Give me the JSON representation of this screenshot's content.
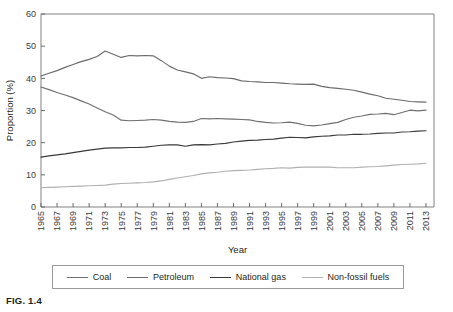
{
  "figure": {
    "caption": "FIG. 1.4"
  },
  "chart_data": {
    "type": "line",
    "title": "",
    "xlabel": "Year",
    "ylabel": "Proportion (%)",
    "xlim": [
      1965,
      2014
    ],
    "ylim": [
      0,
      60
    ],
    "grid": false,
    "legend_position": "bottom",
    "yticks": [
      0,
      10,
      20,
      30,
      40,
      50,
      60
    ],
    "ytick_labels": [
      "0",
      "10",
      "20",
      "30",
      "40",
      "50",
      "60"
    ],
    "xticks": [
      1965,
      1967,
      1969,
      1971,
      1973,
      1975,
      1977,
      1979,
      1981,
      1983,
      1985,
      1987,
      1989,
      1991,
      1993,
      1995,
      1997,
      1999,
      2001,
      2003,
      2005,
      2007,
      2009,
      2011,
      2013
    ],
    "xtick_labels": [
      "1965",
      "1967",
      "1969",
      "1971",
      "1973",
      "1975",
      "1977",
      "1979",
      "1981",
      "1983",
      "1985",
      "1987",
      "1989",
      "1991",
      "1993",
      "1995",
      "1997",
      "1999",
      "2001",
      "2003",
      "2005",
      "2007",
      "2009",
      "2011",
      "2013"
    ],
    "x": [
      1965,
      1966,
      1967,
      1968,
      1969,
      1970,
      1971,
      1972,
      1973,
      1974,
      1975,
      1976,
      1977,
      1978,
      1979,
      1980,
      1981,
      1982,
      1983,
      1984,
      1985,
      1986,
      1987,
      1988,
      1989,
      1990,
      1991,
      1992,
      1993,
      1994,
      1995,
      1996,
      1997,
      1998,
      1999,
      2000,
      2001,
      2002,
      2003,
      2004,
      2005,
      2006,
      2007,
      2008,
      2009,
      2010,
      2011,
      2012,
      2013
    ],
    "series": [
      {
        "name": "Coal",
        "color": "#6f6f6f",
        "values": [
          37.3,
          36.5,
          35.6,
          34.8,
          34.0,
          33.0,
          32.0,
          30.8,
          29.6,
          28.6,
          27.0,
          26.8,
          26.9,
          27.0,
          27.2,
          27.0,
          26.6,
          26.4,
          26.3,
          26.6,
          27.5,
          27.4,
          27.5,
          27.4,
          27.3,
          27.2,
          27.1,
          26.6,
          26.3,
          26.1,
          26.2,
          26.4,
          26.0,
          25.4,
          25.2,
          25.5,
          25.9,
          26.3,
          27.2,
          27.9,
          28.3,
          28.8,
          28.9,
          29.1,
          28.7,
          29.4,
          30.1,
          29.9,
          30.1
        ]
      },
      {
        "name": "Petroleum",
        "color": "#6b6b6b",
        "values": [
          40.7,
          41.6,
          42.4,
          43.4,
          44.3,
          45.2,
          45.9,
          46.8,
          48.5,
          47.5,
          46.5,
          47.1,
          47.0,
          47.1,
          47.0,
          45.5,
          43.8,
          42.6,
          42.0,
          41.4,
          40.0,
          40.5,
          40.2,
          40.1,
          39.9,
          39.2,
          39.0,
          38.9,
          38.7,
          38.7,
          38.5,
          38.3,
          38.2,
          38.1,
          38.2,
          37.5,
          37.1,
          36.9,
          36.6,
          36.3,
          35.7,
          35.1,
          34.6,
          33.8,
          33.5,
          33.2,
          32.8,
          32.7,
          32.6
        ]
      },
      {
        "name": "National gas",
        "color": "#3a3a3a",
        "values": [
          15.5,
          15.9,
          16.2,
          16.5,
          16.9,
          17.3,
          17.7,
          18.0,
          18.3,
          18.4,
          18.4,
          18.5,
          18.5,
          18.6,
          18.9,
          19.2,
          19.3,
          19.3,
          18.9,
          19.3,
          19.4,
          19.3,
          19.6,
          19.8,
          20.2,
          20.5,
          20.7,
          20.8,
          21.0,
          21.1,
          21.4,
          21.7,
          21.6,
          21.5,
          21.8,
          22.0,
          22.1,
          22.4,
          22.4,
          22.6,
          22.6,
          22.7,
          22.9,
          23.0,
          23.0,
          23.3,
          23.4,
          23.6,
          23.7
        ]
      },
      {
        "name": "Non-fossil fuels",
        "color": "#b0b0b0",
        "values": [
          6.0,
          6.1,
          6.2,
          6.3,
          6.4,
          6.5,
          6.6,
          6.7,
          6.8,
          7.1,
          7.3,
          7.4,
          7.5,
          7.6,
          7.8,
          8.1,
          8.6,
          9.0,
          9.4,
          9.8,
          10.3,
          10.6,
          10.8,
          11.1,
          11.3,
          11.4,
          11.5,
          11.7,
          11.9,
          12.0,
          12.2,
          12.1,
          12.3,
          12.4,
          12.4,
          12.4,
          12.4,
          12.2,
          12.2,
          12.2,
          12.4,
          12.5,
          12.6,
          12.8,
          13.0,
          13.2,
          13.3,
          13.4,
          13.6
        ]
      }
    ]
  },
  "legend": {
    "items": [
      {
        "label": "Coal",
        "color": "#6f6f6f"
      },
      {
        "label": "Petroleum",
        "color": "#6b6b6b"
      },
      {
        "label": "National gas",
        "color": "#3a3a3a"
      },
      {
        "label": "Non-fossil fuels",
        "color": "#b0b0b0"
      }
    ]
  }
}
